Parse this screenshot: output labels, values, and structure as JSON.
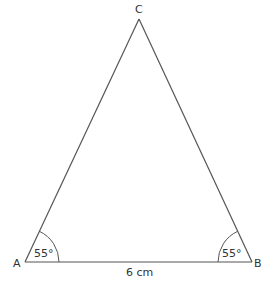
{
  "diagram": {
    "type": "isosceles-triangle",
    "vertices": {
      "A": {
        "label": "A",
        "x": 25,
        "y": 262
      },
      "B": {
        "label": "B",
        "x": 252,
        "y": 262
      },
      "C": {
        "label": "C",
        "x": 139,
        "y": 19
      }
    },
    "angles": {
      "A": "55°",
      "B": "55°"
    },
    "base_length": "6 cm",
    "colors": {
      "stroke": "#555555",
      "text": "#333333",
      "background": "#ffffff"
    }
  }
}
